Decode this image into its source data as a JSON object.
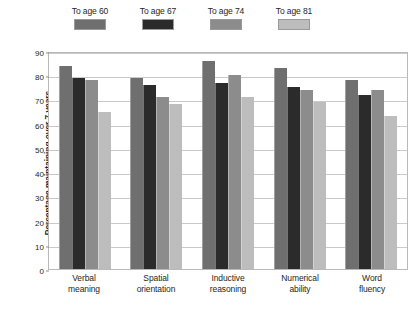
{
  "chart_data": {
    "type": "bar",
    "title": "",
    "xlabel": "",
    "ylabel": "Percentage maintaining over 7 years",
    "ylim": [
      0,
      90
    ],
    "yticks": [
      0,
      10,
      20,
      30,
      40,
      50,
      60,
      70,
      80,
      90
    ],
    "grid": true,
    "legend_position": "top-left",
    "categories": [
      "Verbal\nmeaning",
      "Spatial\norientation",
      "Inductive\nreasoning",
      "Numerical\nability",
      "Word\nfluency"
    ],
    "category_labels": [
      {
        "line1": "Verbal",
        "line2": "meaning"
      },
      {
        "line1": "Spatial",
        "line2": "orientation"
      },
      {
        "line1": "Inductive",
        "line2": "reasoning"
      },
      {
        "line1": "Numerical",
        "line2": "ability"
      },
      {
        "line1": "Word",
        "line2": "fluency"
      }
    ],
    "series": [
      {
        "name": "To age 60",
        "color": "#6f6f6f",
        "values": [
          84,
          79,
          86,
          83,
          78
        ]
      },
      {
        "name": "To age 67",
        "color": "#2b2b2b",
        "values": [
          79,
          76,
          77,
          75,
          72
        ]
      },
      {
        "name": "To age 74",
        "color": "#8c8c8c",
        "values": [
          78,
          71,
          80,
          74,
          74
        ]
      },
      {
        "name": "To age 81",
        "color": "#bdbdbd",
        "values": [
          65,
          68,
          71,
          69,
          63
        ]
      }
    ]
  },
  "legend": {
    "items": [
      {
        "label": "To age 60",
        "color": "#6f6f6f"
      },
      {
        "label": "To age 67",
        "color": "#2b2b2b"
      },
      {
        "label": "To age 74",
        "color": "#8c8c8c"
      },
      {
        "label": "To age 81",
        "color": "#bdbdbd"
      }
    ]
  },
  "axis": {
    "y_title": "Percentage maintaining over 7 years",
    "y_tick_labels": [
      "90",
      "80",
      "70",
      "60",
      "50",
      "40",
      "30",
      "20",
      "10",
      "0"
    ]
  },
  "colors": {
    "frame": "#b9b9b9",
    "gridline": "#c9c9c9",
    "text": "#231f20",
    "background": "#ffffff"
  }
}
